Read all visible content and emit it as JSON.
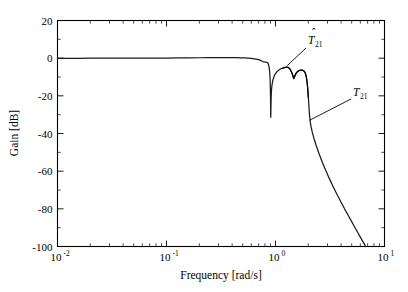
{
  "chart_data": {
    "type": "line",
    "title": "",
    "xlabel": "Frequency [rad/s]",
    "ylabel": "Gain [dB]",
    "xscale": "log",
    "xlim": [
      0.01,
      10
    ],
    "ylim": [
      -100,
      20
    ],
    "grid": false,
    "legend_position": "none",
    "xticks": [
      {
        "value": 0.01,
        "mantissa": "10",
        "exponent": "-2"
      },
      {
        "value": 0.1,
        "mantissa": "10",
        "exponent": "-1"
      },
      {
        "value": 1,
        "mantissa": "10",
        "exponent": "0"
      },
      {
        "value": 10,
        "mantissa": "10",
        "exponent": "1"
      }
    ],
    "yticks": [
      20,
      0,
      -20,
      -40,
      -60,
      -80,
      -100
    ],
    "yticks_minor": [
      10,
      -10,
      -30,
      -50,
      -70,
      -90
    ],
    "annotations": [
      {
        "name": "t-hat-21",
        "base": "T",
        "accent": "hat",
        "subscript": "21",
        "label_text": "T̂21",
        "points_to": {
          "x": 1.28,
          "y": -4.0
        }
      },
      {
        "name": "t-21",
        "base": "T",
        "accent": "none",
        "subscript": "21",
        "label_text": "T21",
        "points_to": {
          "x": 2.05,
          "y": -33.0
        }
      }
    ],
    "series": [
      {
        "name": "T21",
        "style": "solid",
        "color": "#1a1a1a",
        "points": [
          [
            0.01,
            -0.05
          ],
          [
            0.012,
            -0.05
          ],
          [
            0.015,
            -0.05
          ],
          [
            0.02,
            -0.04
          ],
          [
            0.026,
            -0.03
          ],
          [
            0.034,
            -0.02
          ],
          [
            0.045,
            0.0
          ],
          [
            0.06,
            0.02
          ],
          [
            0.08,
            0.05
          ],
          [
            0.1,
            0.08
          ],
          [
            0.13,
            0.12
          ],
          [
            0.16,
            0.17
          ],
          [
            0.2,
            0.22
          ],
          [
            0.24,
            0.26
          ],
          [
            0.28,
            0.29
          ],
          [
            0.32,
            0.3
          ],
          [
            0.36,
            0.3
          ],
          [
            0.4,
            0.28
          ],
          [
            0.44,
            0.24
          ],
          [
            0.48,
            0.18
          ],
          [
            0.52,
            0.1
          ],
          [
            0.56,
            0.0
          ],
          [
            0.6,
            -0.15
          ],
          [
            0.64,
            -0.35
          ],
          [
            0.68,
            -0.62
          ],
          [
            0.7,
            -0.8
          ],
          [
            0.72,
            -1.05
          ],
          [
            0.74,
            -1.35
          ],
          [
            0.755,
            -1.62
          ],
          [
            0.765,
            -1.8
          ],
          [
            0.772,
            -1.92
          ],
          [
            0.778,
            -1.98
          ],
          [
            0.785,
            -2.02
          ],
          [
            0.8,
            -2.05
          ],
          [
            0.82,
            -2.1
          ],
          [
            0.84,
            -2.3
          ],
          [
            0.855,
            -2.8
          ],
          [
            0.865,
            -3.6
          ],
          [
            0.875,
            -5.0
          ],
          [
            0.882,
            -6.8
          ],
          [
            0.888,
            -9.0
          ],
          [
            0.893,
            -12.0
          ],
          [
            0.897,
            -16.0
          ],
          [
            0.9,
            -21.0
          ],
          [
            0.902,
            -26.0
          ],
          [
            0.9035,
            -30.0
          ],
          [
            0.9045,
            -31.4
          ],
          [
            0.9055,
            -30.6
          ],
          [
            0.9075,
            -27.0
          ],
          [
            0.91,
            -23.0
          ],
          [
            0.914,
            -19.5
          ],
          [
            0.92,
            -16.5
          ],
          [
            0.93,
            -14.0
          ],
          [
            0.945,
            -11.8
          ],
          [
            0.965,
            -10.0
          ],
          [
            0.99,
            -8.6
          ],
          [
            1.02,
            -7.5
          ],
          [
            1.06,
            -6.6
          ],
          [
            1.1,
            -5.9
          ],
          [
            1.15,
            -5.35
          ],
          [
            1.2,
            -5.0
          ],
          [
            1.24,
            -4.85
          ],
          [
            1.27,
            -4.82
          ],
          [
            1.3,
            -4.95
          ],
          [
            1.33,
            -5.3
          ],
          [
            1.36,
            -5.9
          ],
          [
            1.39,
            -6.8
          ],
          [
            1.42,
            -8.0
          ],
          [
            1.445,
            -9.2
          ],
          [
            1.46,
            -10.0
          ],
          [
            1.47,
            -10.4
          ],
          [
            1.48,
            -10.3
          ],
          [
            1.495,
            -9.7
          ],
          [
            1.52,
            -8.7
          ],
          [
            1.55,
            -7.8
          ],
          [
            1.59,
            -7.1
          ],
          [
            1.64,
            -6.6
          ],
          [
            1.7,
            -6.3
          ],
          [
            1.76,
            -6.3
          ],
          [
            1.82,
            -6.7
          ],
          [
            1.86,
            -7.4
          ],
          [
            1.89,
            -8.4
          ],
          [
            1.92,
            -10.0
          ],
          [
            1.945,
            -12.0
          ],
          [
            1.965,
            -14.5
          ],
          [
            1.985,
            -17.5
          ],
          [
            2.0,
            -20.5
          ],
          [
            2.015,
            -23.5
          ],
          [
            2.03,
            -26.5
          ],
          [
            2.05,
            -30.0
          ],
          [
            2.08,
            -33.5
          ],
          [
            2.12,
            -36.5
          ],
          [
            2.18,
            -39.5
          ],
          [
            2.25,
            -42.5
          ],
          [
            2.35,
            -46.0
          ],
          [
            2.5,
            -50.5
          ],
          [
            2.7,
            -55.5
          ],
          [
            2.9,
            -59.8
          ],
          [
            3.15,
            -64.5
          ],
          [
            3.4,
            -68.5
          ],
          [
            3.7,
            -72.8
          ],
          [
            4.0,
            -76.5
          ],
          [
            4.3,
            -80.0
          ],
          [
            4.6,
            -83.0
          ],
          [
            5.0,
            -86.8
          ],
          [
            5.2,
            -88.6
          ],
          [
            5.4,
            -90.3
          ],
          [
            5.7,
            -92.7
          ],
          [
            6.0,
            -95.0
          ],
          [
            6.4,
            -97.8
          ],
          [
            6.7,
            -99.8
          ],
          [
            6.75,
            -100.0
          ]
        ]
      },
      {
        "name": "T21hat",
        "style": "solid-overlay",
        "color": "#000000",
        "note": "Estimated model response; nearly coincident with T21 except minor deviations around the resonant peaks near 1.3-2.0 rad/s",
        "points": [
          [
            1.15,
            -5.45
          ],
          [
            1.2,
            -5.05
          ],
          [
            1.24,
            -4.88
          ],
          [
            1.27,
            -4.78
          ],
          [
            1.3,
            -4.88
          ],
          [
            1.33,
            -5.22
          ],
          [
            1.36,
            -5.85
          ],
          [
            1.39,
            -6.9
          ],
          [
            1.42,
            -8.2
          ],
          [
            1.445,
            -9.6
          ],
          [
            1.46,
            -10.5
          ],
          [
            1.47,
            -10.9
          ],
          [
            1.48,
            -10.7
          ],
          [
            1.495,
            -10.0
          ],
          [
            1.52,
            -8.95
          ],
          [
            1.55,
            -8.0
          ],
          [
            1.59,
            -7.25
          ],
          [
            1.64,
            -6.72
          ],
          [
            1.7,
            -6.4
          ],
          [
            1.76,
            -6.38
          ],
          [
            1.82,
            -6.8
          ],
          [
            1.86,
            -7.55
          ],
          [
            1.89,
            -8.6
          ],
          [
            1.92,
            -10.3
          ],
          [
            1.945,
            -12.4
          ],
          [
            1.965,
            -14.9
          ],
          [
            1.985,
            -17.9
          ],
          [
            2.0,
            -20.9
          ]
        ]
      }
    ]
  }
}
